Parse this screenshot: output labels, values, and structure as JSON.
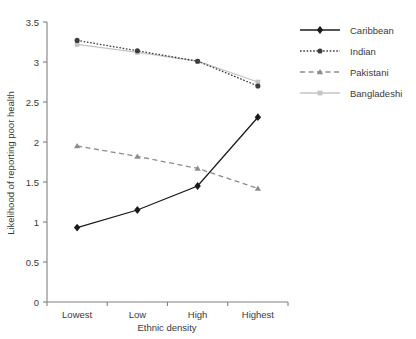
{
  "chart_data": {
    "type": "line",
    "title": "",
    "xlabel": "Ethnic density",
    "ylabel": "Likelihood of reporting poor health",
    "categories": [
      "Lowest",
      "Low",
      "High",
      "Highest"
    ],
    "ylim": [
      0,
      3.5
    ],
    "yticks": [
      "0",
      "0.5",
      "1",
      "1.5",
      "2",
      "2.5",
      "3",
      "3.5"
    ],
    "ytick_values": [
      0,
      0.5,
      1,
      1.5,
      2,
      2.5,
      3,
      3.5
    ],
    "grid": false,
    "legend_position": "right",
    "series": [
      {
        "name": "Caribbean",
        "values": [
          0.93,
          1.15,
          1.45,
          2.31
        ],
        "color": "#1a1a1a",
        "line_style": "solid",
        "marker": "diamond"
      },
      {
        "name": "Indian",
        "values": [
          3.27,
          3.14,
          3.01,
          2.7
        ],
        "color": "#3d3d3d",
        "line_style": "dotted",
        "marker": "circle"
      },
      {
        "name": "Pakistani",
        "values": [
          1.95,
          1.82,
          1.67,
          1.42
        ],
        "color": "#8c8c8c",
        "line_style": "dashed",
        "marker": "triangle"
      },
      {
        "name": "Bangladeshi",
        "values": [
          3.22,
          3.12,
          3.01,
          2.75
        ],
        "color": "#c4c4c4",
        "line_style": "solid",
        "marker": "square"
      }
    ]
  },
  "legend": {
    "items": [
      {
        "label": "Caribbean"
      },
      {
        "label": "Indian"
      },
      {
        "label": "Pakistani"
      },
      {
        "label": "Bangladeshi"
      }
    ]
  },
  "axes": {
    "x_title": "Ethnic density",
    "y_title": "Likelihood of reporting poor health"
  }
}
